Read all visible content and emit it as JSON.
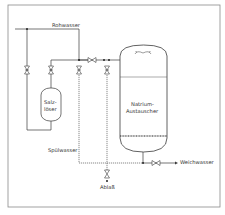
{
  "diagram": {
    "labels": {
      "rohwasser": "Rohwasser",
      "salzloeser_line1": "Salz-",
      "salzloeser_line2": "löser",
      "natrium_line1": "Natrium-",
      "natrium_line2": "Austauscher",
      "spuelwasser": "Spülwasser",
      "ablass": "Ablaß",
      "weichwasser": "Weichwasser"
    },
    "colors": {
      "line": "#3a3a3a",
      "frame": "#8a8a8a",
      "background": "#ffffff"
    },
    "components": [
      {
        "name": "Salzlöser",
        "type": "tank"
      },
      {
        "name": "Natrium-Austauscher",
        "type": "pressure-vessel"
      },
      {
        "name": "valves",
        "count": 7
      }
    ]
  }
}
